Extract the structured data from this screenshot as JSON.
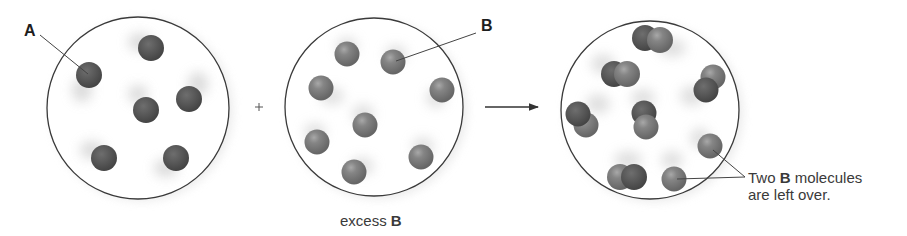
{
  "diagram": {
    "title": "",
    "operators": {
      "plus": "+",
      "arrow": "→"
    },
    "colors": {
      "background": "#ffffff",
      "circle_stroke": "#3a3a3a",
      "molecule_A": "#555555",
      "molecule_B": "#7b7b7b",
      "text": "#2a2a2a"
    },
    "containers": [
      {
        "id": "reactant-A",
        "label": "A",
        "molecule_count": 6,
        "molecule_type": "A"
      },
      {
        "id": "reactant-B",
        "label": "B",
        "caption_prefix": "excess ",
        "caption_bold": "B",
        "molecule_count": 8,
        "molecule_type": "B"
      },
      {
        "id": "product",
        "pair_count": 6,
        "leftover_B_count": 2,
        "annotation_line1_prefix": "Two ",
        "annotation_line1_bold": "B",
        "annotation_line1_suffix": " molecules",
        "annotation_line2": "are left over."
      }
    ]
  }
}
